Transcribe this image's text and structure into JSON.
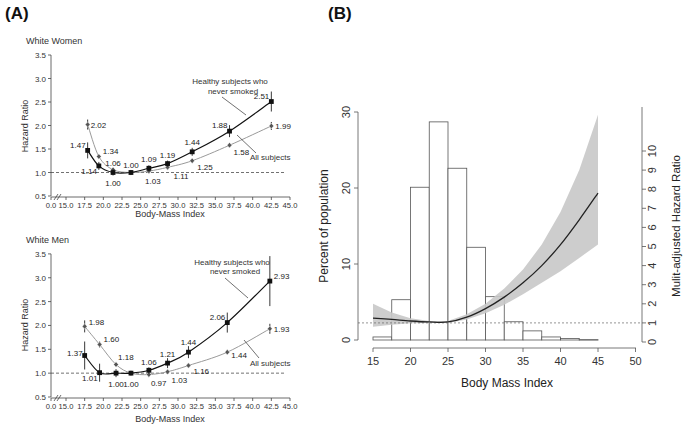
{
  "panel_a": {
    "label": "(A)",
    "women": {
      "title": "White Women",
      "ylabel": "Hazard Ratio",
      "xlabel": "Body-Mass Index",
      "yticks": [
        "0.5",
        "1.0",
        "1.5",
        "2.0",
        "2.5",
        "3.0",
        "3.5"
      ],
      "xticks": [
        "0.0",
        "15.0",
        "17.5",
        "20.0",
        "22.5",
        "25.0",
        "27.5",
        "30.0",
        "32.5",
        "35.0",
        "37.5",
        "40.0",
        "42.5",
        "45.0"
      ],
      "legend_healthy": [
        "Healthy subjects who",
        "never smoked"
      ],
      "legend_all": "All subjects"
    },
    "men": {
      "title": "White Men",
      "ylabel": "Hazard Ratio",
      "xlabel": "Body-Mass Index",
      "yticks": [
        "0.5",
        "1.0",
        "1.5",
        "2.0",
        "2.5",
        "3.0",
        "3.5"
      ],
      "xticks": [
        "0.0",
        "15.0",
        "17.5",
        "20.0",
        "22.5",
        "25.0",
        "27.5",
        "30.0",
        "32.5",
        "35.0",
        "37.5",
        "40.0",
        "42.5",
        "45.0"
      ],
      "legend_healthy": [
        "Healthy subjects who",
        "never smoked"
      ],
      "legend_all": "All subjects"
    }
  },
  "panel_b": {
    "label": "(B)",
    "xlabel": "Body Mass Index",
    "ylabel_left": "Percent of population",
    "ylabel_right": "Mulit-adjusted Hazard Ratio",
    "xticks": [
      "15",
      "20",
      "25",
      "30",
      "35",
      "40",
      "45",
      "50"
    ],
    "yticks_left": [
      "0",
      "10",
      "20",
      "30"
    ],
    "yticks_right": [
      "0",
      "1",
      "2",
      "3",
      "4",
      "5",
      "6",
      "7",
      "8",
      "9",
      "10"
    ]
  },
  "chart_data": [
    {
      "type": "line",
      "title": "White Women",
      "xlabel": "Body-Mass Index",
      "ylabel": "Hazard Ratio",
      "ylim": [
        0.5,
        3.5
      ],
      "xlim": [
        15,
        45
      ],
      "reference_line": 1.0,
      "series": [
        {
          "name": "Healthy subjects who never smoked",
          "color": "#111111",
          "marker": "square",
          "x": [
            17.9,
            19.4,
            21.3,
            23.7,
            26.1,
            28.6,
            31.9,
            36.9,
            42.5
          ],
          "values": [
            1.47,
            1.14,
            1.0,
            1.0,
            1.09,
            1.19,
            1.44,
            1.88,
            2.51
          ],
          "labels": [
            "1.47",
            "1.14",
            "1.00",
            "1.00",
            "1.09",
            "1.19",
            "1.44",
            "1.88",
            "2.51"
          ]
        },
        {
          "name": "All subjects",
          "color": "#9a9a9a",
          "marker": "diamond",
          "x": [
            17.9,
            19.4,
            21.3,
            23.7,
            26.1,
            28.6,
            31.9,
            36.9,
            42.5
          ],
          "values": [
            2.02,
            1.34,
            1.06,
            1.0,
            1.03,
            1.11,
            1.25,
            1.58,
            1.99
          ],
          "labels": [
            "2.02",
            "1.34",
            "1.06",
            "",
            "1.03",
            "1.11",
            "1.25",
            "1.58",
            "1.99"
          ]
        }
      ]
    },
    {
      "type": "line",
      "title": "White Men",
      "xlabel": "Body-Mass Index",
      "ylabel": "Hazard Ratio",
      "ylim": [
        0.5,
        3.5
      ],
      "xlim": [
        15,
        45
      ],
      "reference_line": 1.0,
      "series": [
        {
          "name": "Healthy subjects who never smoked",
          "color": "#111111",
          "marker": "square",
          "x": [
            17.5,
            19.5,
            21.7,
            23.7,
            26.1,
            28.6,
            31.4,
            36.6,
            42.3
          ],
          "values": [
            1.37,
            1.01,
            1.0,
            1.0,
            1.06,
            1.21,
            1.44,
            2.06,
            2.93
          ],
          "labels": [
            "1.37",
            "1.01",
            "1.00",
            "1.00",
            "1.06",
            "1.21",
            "1.44",
            "2.06",
            "2.93"
          ]
        },
        {
          "name": "All subjects",
          "color": "#9a9a9a",
          "marker": "diamond",
          "x": [
            17.5,
            19.5,
            21.7,
            23.7,
            26.1,
            28.6,
            31.4,
            36.6,
            42.3
          ],
          "values": [
            1.98,
            1.6,
            1.18,
            1.0,
            0.97,
            1.03,
            1.16,
            1.44,
            1.93
          ],
          "labels": [
            "1.98",
            "1.60",
            "1.18",
            "",
            "0.97",
            "1.03",
            "1.16",
            "1.44",
            "1.93"
          ]
        }
      ]
    },
    {
      "type": "bar",
      "title": "",
      "xlabel": "Body Mass Index",
      "ylabel": "Percent of population",
      "ylim": [
        0,
        30
      ],
      "bin_edges": [
        15,
        17.5,
        20,
        22.5,
        25,
        27.5,
        30,
        32.5,
        35,
        37.5,
        40,
        42.5,
        45
      ],
      "values": [
        0.4,
        5.3,
        20.1,
        28.7,
        22.6,
        12.2,
        5.7,
        2.4,
        1.2,
        0.4,
        0.2,
        0.05
      ]
    },
    {
      "type": "line",
      "title": "",
      "xlabel": "Body Mass Index",
      "ylabel": "Mulit-adjusted Hazard Ratio",
      "ylim": [
        0,
        12
      ],
      "reference_line": 1.0,
      "x": [
        15,
        17.5,
        20,
        22.5,
        25,
        27.5,
        30,
        32.5,
        35,
        37.5,
        40,
        42.5,
        45
      ],
      "series": [
        {
          "name": "Hazard ratio",
          "values": [
            1.25,
            1.18,
            1.1,
            1.05,
            1.05,
            1.3,
            1.75,
            2.35,
            3.1,
            4.0,
            5.1,
            6.4,
            7.8
          ]
        },
        {
          "name": "CI upper",
          "values": [
            2.0,
            1.55,
            1.25,
            1.1,
            1.1,
            1.45,
            2.0,
            2.8,
            3.8,
            5.1,
            6.8,
            9.0,
            11.9
          ]
        },
        {
          "name": "CI lower",
          "values": [
            0.8,
            0.9,
            0.98,
            1.0,
            1.0,
            1.18,
            1.5,
            1.95,
            2.5,
            3.1,
            3.7,
            4.4,
            5.1
          ]
        }
      ]
    }
  ]
}
